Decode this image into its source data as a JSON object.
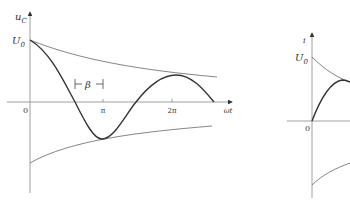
{
  "left_plot": {
    "y_axis_label": "u",
    "y_axis_sub": "C",
    "y0_label": "U",
    "y0_sub": "0",
    "origin_label": "0",
    "x_axis_label": "ωt",
    "tick_pi": "π",
    "tick_2pi": "2π",
    "phase_label": "β",
    "curves": [
      "damped-cosine",
      "upper-envelope",
      "lower-envelope"
    ]
  },
  "right_plot": {
    "y_axis_label": "i",
    "y0_label": "U",
    "y0_sub": "0",
    "origin_label": "0",
    "curves": [
      "damped-sine",
      "upper-envelope",
      "lower-envelope"
    ]
  },
  "colors": {
    "axis": "#888888",
    "curve": "#333333",
    "envelope": "#666666"
  }
}
